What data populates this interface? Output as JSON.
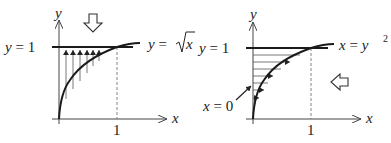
{
  "figure": {
    "left_panel": {
      "title": "Vertical slicing (integrate in x)",
      "y_axis_label": "y",
      "x_axis_label": "x",
      "line_label_lhs": "y = 1",
      "line_label_y": "y",
      "line_label_eq": "=",
      "line_label_one": "1",
      "curve_label_lhs": "y",
      "curve_label_eq": "=",
      "curve_label_var": "x",
      "curve_label_full": "y = √x",
      "x_tick_label": "1",
      "direction_arrow": "down-arrow-icon",
      "slice_arrows": "upward vertical arrows from curve to y = 1"
    },
    "right_panel": {
      "title": "Horizontal slicing (integrate in y)",
      "y_axis_label": "y",
      "x_axis_label": "x",
      "line_label_y": "y",
      "line_label_eq": "=",
      "line_label_one": "1",
      "curve_label_lhs": "x",
      "curve_label_eq": "=",
      "curve_label_var": "y",
      "curve_label_exp": "2",
      "curve_label_full": "x = y²",
      "x_tick_label": "1",
      "boundary_label_var": "x",
      "boundary_label_eq": "=",
      "boundary_label_zero": "0",
      "boundary_label_full": "x = 0",
      "direction_arrow": "left-arrow-icon",
      "slice_arrows": "rightward horizontal arrows from y-axis to curve"
    },
    "colors": {
      "stroke": "#1a1a1a",
      "thin_stroke": "#555555",
      "background": "#ffffff"
    }
  }
}
